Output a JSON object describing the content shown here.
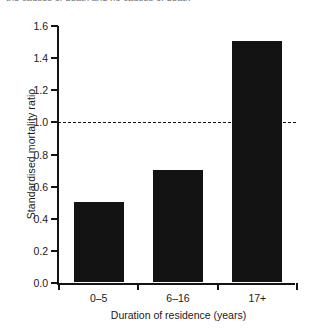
{
  "caption_fragment": "the  causes of death and no causes of death",
  "chart_data": {
    "type": "bar",
    "title": "",
    "categories": [
      "0–5",
      "6–16",
      "17+"
    ],
    "values": [
      0.5,
      0.7,
      1.5
    ],
    "series": [
      {
        "name": "Standardised mortality ratio",
        "values": [
          0.5,
          0.7,
          1.5
        ]
      }
    ],
    "xlabel": "Duration of residence (years)",
    "ylabel": "Standardised mortality ratio",
    "ylim": [
      0.0,
      1.6
    ],
    "ytick_labels": [
      "0.0",
      "0.2",
      "0.4",
      "0.6",
      "0.8",
      "1.0",
      "1.2",
      "1.4",
      "1.6"
    ],
    "ytick_values": [
      0.0,
      0.2,
      0.4,
      0.6,
      0.8,
      1.0,
      1.2,
      1.4,
      1.6
    ],
    "grid": false,
    "legend": "none",
    "bar_color": "#131313",
    "axis_color": "#131313",
    "background": "#ffffff",
    "reference_line": {
      "value": 1.0,
      "style": "dashed",
      "color": "#131313"
    }
  }
}
